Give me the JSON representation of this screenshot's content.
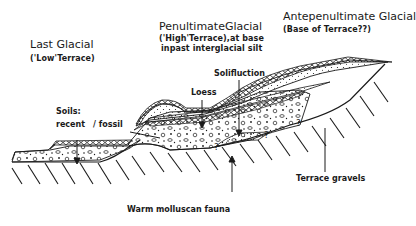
{
  "diagram": {
    "type": "geological cross-section of river terraces",
    "headings": {
      "last_glacial": {
        "title": "Last Glacial",
        "subtitle": "('Low'Terrace)"
      },
      "penultimate_glacial": {
        "title": "PenultimateGlacial",
        "subtitle_line1": "('High'Terrace),at base",
        "subtitle_line2": "inpast interglacial silt"
      },
      "antepenultimate_glacial": {
        "title": "Antepenultimate Glacial",
        "subtitle": "(Base of Terrace??)"
      }
    },
    "annotations": {
      "soils_line1": "Soils:",
      "soils_line2_recent": "recent",
      "soils_line2_fossil": "/ fossil",
      "loess": "Loess",
      "solifluction": "Solifluction",
      "terrace_gravels": "Terrace gravels",
      "warm_mollusc": "Warm molluscan fauna"
    },
    "uncertainty_marks": [
      "?",
      "?",
      "?"
    ],
    "colors": {
      "ink": "#1a1a1a",
      "background": "#ffffff"
    }
  }
}
